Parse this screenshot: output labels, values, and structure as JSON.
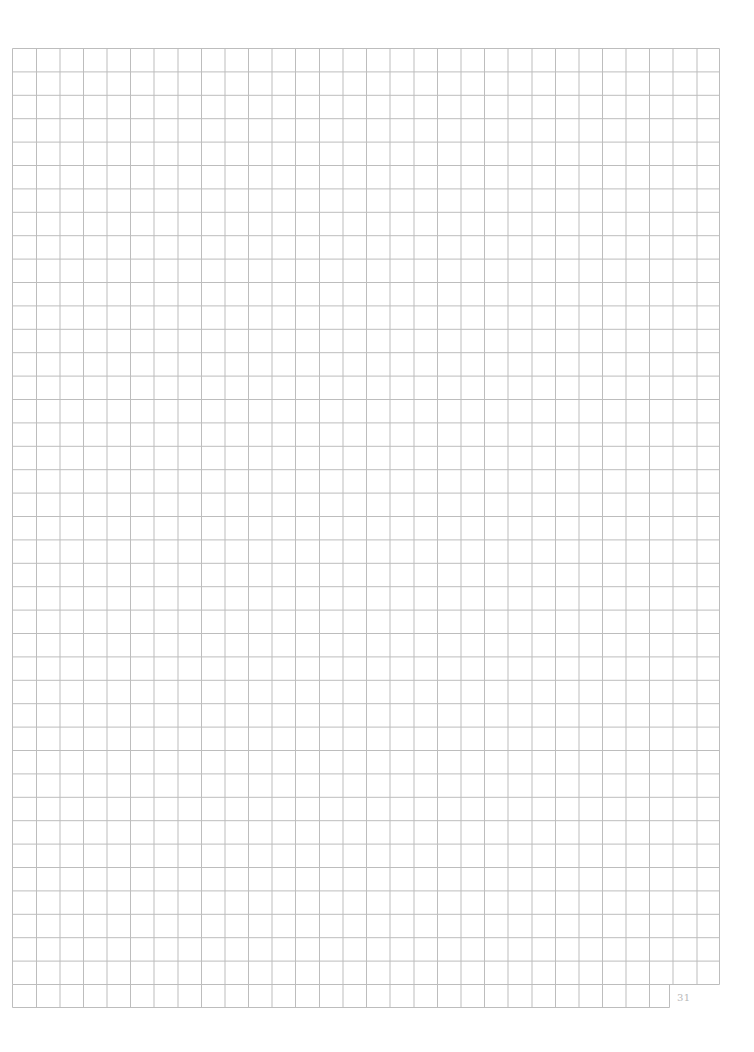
{
  "page": {
    "type": "graph-paper",
    "background_color": "#ffffff",
    "line_color": "#bdbdbd",
    "page_number": "31"
  },
  "grid": {
    "left": 12.5,
    "top": 48.5,
    "right": 719.5,
    "main_bottom": 984.5,
    "columns_x": [
      12.5,
      36.5,
      60,
      83.5,
      107,
      130.5,
      154,
      178,
      201.5,
      225,
      248.5,
      272,
      295.5,
      319.5,
      343,
      366.5,
      390,
      414,
      437.5,
      461,
      484.5,
      508,
      532,
      555.5,
      579,
      602.5,
      626,
      649.5,
      673,
      697,
      719.5
    ],
    "rows_count_main": 40,
    "last_row": {
      "top": 984.5,
      "bottom": 1007.5,
      "right": 669.5
    }
  }
}
